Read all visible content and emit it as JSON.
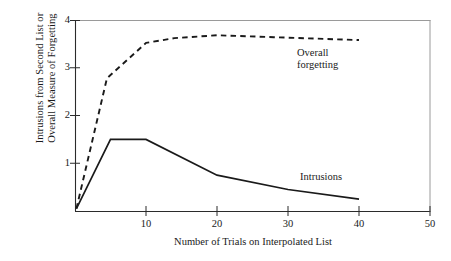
{
  "chart_data": {
    "type": "line",
    "title": "",
    "xlabel": "Number of Trials on Interpolated List",
    "ylabel": "Intrusions from Second List or Overall Measure of Forgetting",
    "ylabel_lines": [
      "Intrusions from Second List or",
      "Overall Measure of Forgetting"
    ],
    "xlim": [
      0,
      50
    ],
    "ylim": [
      0,
      4
    ],
    "xticks": [
      10,
      20,
      30,
      40,
      50
    ],
    "yticks": [
      1,
      2,
      3,
      4
    ],
    "xtick_labels": [
      "10",
      "20",
      "30",
      "40",
      "50"
    ],
    "ytick_labels": [
      "1",
      "2",
      "3",
      "4"
    ],
    "grid": false,
    "legend": "inline-annotations",
    "series": [
      {
        "name": "Overall forgetting",
        "style": "dashed",
        "color": "#1a1a1a",
        "points": [
          {
            "x": 0.2,
            "y": 0.05
          },
          {
            "x": 4.5,
            "y": 2.78
          },
          {
            "x": 10,
            "y": 3.52
          },
          {
            "x": 14,
            "y": 3.62
          },
          {
            "x": 20,
            "y": 3.68
          },
          {
            "x": 28,
            "y": 3.64
          },
          {
            "x": 40,
            "y": 3.58
          }
        ]
      },
      {
        "name": "Intrusions",
        "style": "solid",
        "color": "#1a1a1a",
        "points": [
          {
            "x": 0.2,
            "y": 0.05
          },
          {
            "x": 5,
            "y": 1.5
          },
          {
            "x": 10,
            "y": 1.5
          },
          {
            "x": 20,
            "y": 0.75
          },
          {
            "x": 30,
            "y": 0.45
          },
          {
            "x": 40,
            "y": 0.25
          }
        ]
      }
    ],
    "annotations": [
      {
        "name": "overall-forgetting",
        "lines": [
          "Overall",
          "forgetting"
        ],
        "x_px": 297,
        "y_px": 47
      },
      {
        "name": "intrusions",
        "lines": [
          "Intrusions"
        ],
        "x_px": 300,
        "y_px": 171
      }
    ]
  },
  "axes": {
    "plot_left_px": 75,
    "plot_right_px": 430,
    "plot_top_px": 20,
    "plot_bottom_px": 211
  }
}
